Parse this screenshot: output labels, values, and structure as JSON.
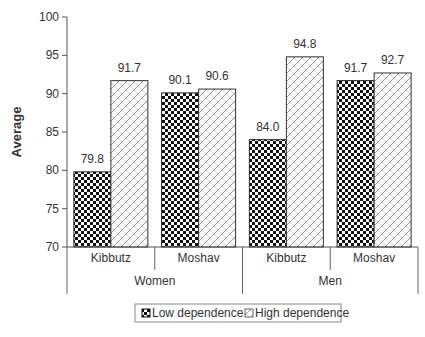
{
  "chart_data": {
    "type": "bar",
    "title": "",
    "xlabel": "",
    "ylabel": "Average",
    "ylim": [
      70,
      100
    ],
    "yticks": [
      70,
      75,
      80,
      85,
      90,
      95,
      100
    ],
    "yticks_labels": [
      "70",
      "75",
      "80",
      "85",
      "90",
      "95",
      "100"
    ],
    "grid": false,
    "groups": [
      {
        "label": "Women",
        "categories": [
          "Kibbutz",
          "Moshav"
        ]
      },
      {
        "label": "Men",
        "categories": [
          "Kibbutz",
          "Moshav"
        ]
      }
    ],
    "categories": [
      "Kibbutz",
      "Moshav",
      "Kibbutz",
      "Moshav"
    ],
    "series": [
      {
        "name": "Low dependence",
        "pattern": "checkerboard",
        "values": [
          79.8,
          90.1,
          84.0,
          91.7
        ],
        "labels": [
          "79.8",
          "90.1",
          "84.0",
          "91.7"
        ]
      },
      {
        "name": "High dependence",
        "pattern": "diagonal-hatch",
        "values": [
          91.7,
          90.6,
          94.8,
          92.7
        ],
        "labels": [
          "91.7",
          "90.6",
          "94.8",
          "92.7"
        ]
      }
    ],
    "legend": {
      "position": "bottom",
      "entries": [
        "Low dependence",
        "High dependence"
      ]
    },
    "colors": {
      "axis": "#555555",
      "text": "#333333",
      "low_fill": "#111111",
      "high_stroke": "#888888"
    }
  }
}
